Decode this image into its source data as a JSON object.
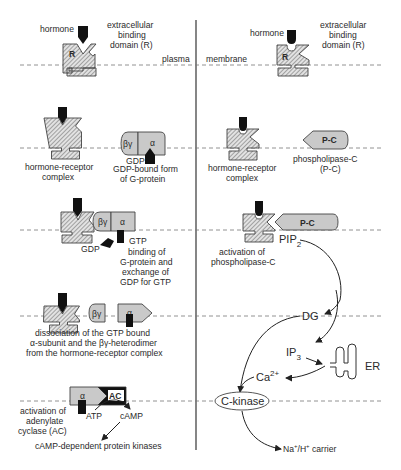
{
  "diagram": {
    "title_left_membrane_label": "plasma",
    "title_right_membrane_label": "membrane",
    "colors": {
      "background": "#ffffff",
      "receptor_hatch": "#9a9a9a",
      "g_protein_fill": "#c9c9c9",
      "hormone_fill": "#111111",
      "adenylate_cyclase_fill": "#111111",
      "line": "#222222",
      "dashed_membrane": "#777777"
    },
    "left_panel": {
      "step1": {
        "hormone": "hormone",
        "receptor_letter": "R",
        "domain_label": [
          "extracellular",
          "binding",
          "domain (R)"
        ]
      },
      "step2": {
        "complex_label": [
          "hormone-receptor",
          "complex"
        ],
        "beta_gamma": "βγ",
        "alpha": "α",
        "gdp": "GDP",
        "gprotein_label": [
          "GDP-bound form",
          "of G-protein"
        ]
      },
      "step3": {
        "beta_gamma": "βγ",
        "alpha": "α",
        "gdp": "GDP",
        "gtp": "GTP",
        "description": [
          "binding of",
          "G-protein and",
          "exchange of",
          "GDP for GTP"
        ]
      },
      "step4": {
        "beta_gamma": "βγ",
        "alpha": "α",
        "description": [
          "dissociation of the GTP bound",
          "α-subunit and the βγ-heterodimer",
          "from the hormone-receptor complex"
        ]
      },
      "step5": {
        "alpha": "α",
        "ac": "AC",
        "atp": "ATP",
        "camp": "cAMP",
        "description": [
          "activation of",
          "adenylate",
          "cyclase (AC)"
        ],
        "downstream": "cAMP-dependent protein kinases"
      }
    },
    "right_panel": {
      "step1": {
        "hormone": "hormone",
        "receptor_letter": "R",
        "domain_label": [
          "extracellular",
          "binding",
          "domain (R)"
        ]
      },
      "step2": {
        "complex_label": [
          "hormone-receptor",
          "complex"
        ],
        "pc": "P-C",
        "pc_label": [
          "phospholipase-C",
          "(P-C)"
        ]
      },
      "step3": {
        "pc": "P-C",
        "pip2": "PIP",
        "pip2_sub": "2",
        "description": [
          "activation of",
          "phospholipase-C"
        ]
      },
      "cascade": {
        "dg": "DG",
        "ip3": "IP",
        "ip3_sub": "3",
        "er": "ER",
        "ca": "Ca",
        "ca_sup": "2+",
        "ckinase": "C-kinase",
        "carrier_na": "Na",
        "carrier_h": "/H",
        "carrier_plus": "+",
        "carrier_rest": " carrier"
      }
    }
  }
}
